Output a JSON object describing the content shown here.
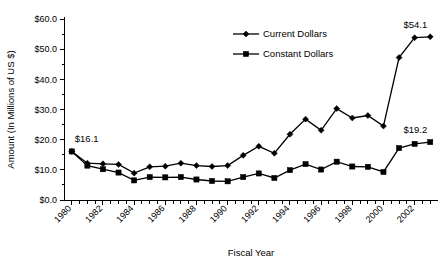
{
  "chart_data": {
    "type": "line",
    "title": "",
    "xlabel": "Fiscal Year",
    "ylabel": "Amount (In Millions of US $)",
    "x": [
      1980,
      1981,
      1982,
      1983,
      1984,
      1985,
      1986,
      1987,
      1988,
      1989,
      1990,
      1991,
      1992,
      1993,
      1994,
      1995,
      1996,
      1997,
      1998,
      1999,
      2000,
      2001,
      2002,
      2003
    ],
    "xlim": [
      1979.5,
      2003.5
    ],
    "ylim": [
      0,
      60
    ],
    "yticks": [
      0,
      10,
      20,
      30,
      40,
      50,
      60
    ],
    "ytick_labels": [
      "$0.0",
      "$10.0",
      "$20.0",
      "$30.0",
      "$40.0",
      "$50.0",
      "$60.0"
    ],
    "xtick_labels": [
      "1980",
      "1982",
      "1984",
      "1986",
      "1988",
      "1990",
      "1992",
      "1994",
      "1996",
      "1998",
      "2000",
      "2002"
    ],
    "xticks_major": [
      1980,
      1982,
      1984,
      1986,
      1988,
      1990,
      1992,
      1994,
      1996,
      1998,
      2000,
      2002
    ],
    "xtick_rotation": -45,
    "grid": false,
    "legend_position": "top-right",
    "series": [
      {
        "name": "Current Dollars",
        "marker": "diamond",
        "values": [
          16.1,
          12.2,
          12.0,
          11.8,
          8.9,
          11.0,
          11.2,
          12.2,
          11.4,
          11.1,
          11.4,
          14.8,
          17.8,
          15.5,
          21.8,
          26.8,
          23.1,
          30.3,
          27.2,
          28.0,
          24.5,
          47.2,
          53.8,
          54.1
        ]
      },
      {
        "name": "Constant Dollars",
        "marker": "square",
        "values": [
          16.1,
          11.4,
          10.2,
          9.1,
          6.5,
          7.6,
          7.5,
          7.6,
          6.8,
          6.3,
          6.2,
          7.6,
          8.8,
          7.3,
          9.9,
          11.9,
          10.1,
          12.7,
          11.1,
          11.0,
          9.3,
          17.2,
          18.6,
          19.2
        ]
      }
    ],
    "annotations": [
      {
        "label": "$16.1",
        "x": 1980,
        "y": 16.1,
        "position": "above"
      },
      {
        "label": "$54.1",
        "x": 2003,
        "y": 54.1,
        "position": "above"
      },
      {
        "label": "$19.2",
        "x": 2003,
        "y": 19.2,
        "position": "above"
      }
    ]
  },
  "legend": {
    "items": [
      {
        "label": "Current Dollars",
        "marker": "diamond"
      },
      {
        "label": "Constant Dollars",
        "marker": "square"
      }
    ]
  }
}
